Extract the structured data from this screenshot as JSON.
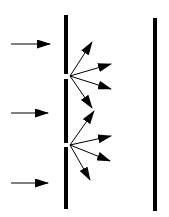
{
  "diagram": {
    "colors": {
      "ink": "#000000",
      "background": "#ffffff"
    },
    "incident_arrows": [
      {
        "x1": 11,
        "x2": 50,
        "y": 44
      },
      {
        "x1": 11,
        "x2": 48,
        "y": 113
      },
      {
        "x1": 11,
        "x2": 48,
        "y": 183
      }
    ],
    "barrier": {
      "x": 66,
      "width": 4,
      "segments": [
        [
          15,
          74
        ],
        [
          79,
          143
        ],
        [
          147,
          209
        ]
      ]
    },
    "screen": {
      "x": 155,
      "width": 4,
      "y1": 18,
      "y2": 211
    },
    "slits": [
      {
        "x": 70,
        "y": 76,
        "rays": [
          [
            92,
            42
          ],
          [
            111,
            64
          ],
          [
            111,
            89
          ],
          [
            92,
            108
          ]
        ]
      },
      {
        "x": 70,
        "y": 145,
        "rays": [
          [
            94,
            111
          ],
          [
            111,
            136
          ],
          [
            110,
            161
          ],
          [
            90,
            180
          ]
        ]
      }
    ]
  }
}
